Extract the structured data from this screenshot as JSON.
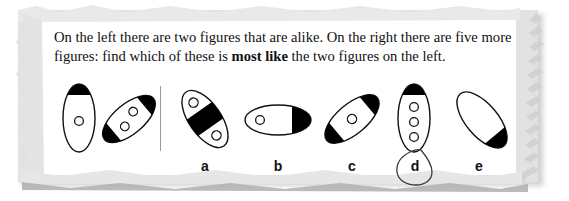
{
  "page": {
    "background_color": "#ffffff",
    "paper_color": "#ffffff",
    "paper_edge_color": "#e2e2e2",
    "shadow_color": "#c9c9c9",
    "ink_color": "#101010",
    "fill_color": "#000000",
    "divider_color": "#9a9a9a"
  },
  "question": {
    "line1_part1": "On the left there are two figures that are alike. On the right there are five more",
    "line2_part1": "figures: find which of these is ",
    "line2_bold": "most like",
    "line2_part2": " the two figures on the left."
  },
  "prompt_figures": {
    "label": "two figures that are alike",
    "items": [
      {
        "id": "prompt-figure-1",
        "shape": "ellipse",
        "orientation_deg": 0,
        "black_caps": [
          "top"
        ],
        "circle_count": 1
      },
      {
        "id": "prompt-figure-2",
        "shape": "ellipse",
        "orientation_deg": -40,
        "black_caps": [
          "top",
          "bottom"
        ],
        "circle_count": 2
      }
    ]
  },
  "options": [
    {
      "letter": "a",
      "shape": "ellipse",
      "orientation_deg": 55,
      "black_caps": [],
      "black_band": "middle",
      "circle_count": 2,
      "selected": false
    },
    {
      "letter": "b",
      "shape": "ellipse",
      "orientation_deg": 90,
      "black_caps": [
        "right"
      ],
      "black_band": "",
      "circle_count": 1,
      "selected": false
    },
    {
      "letter": "c",
      "shape": "ellipse",
      "orientation_deg": -40,
      "black_caps": [
        "top",
        "bottom"
      ],
      "black_band": "",
      "circle_count": 1,
      "selected": false
    },
    {
      "letter": "d",
      "shape": "ellipse",
      "orientation_deg": 0,
      "black_caps": [
        "top"
      ],
      "black_band": "",
      "circle_count": 3,
      "selected": true
    },
    {
      "letter": "e",
      "shape": "ellipse",
      "orientation_deg": 50,
      "black_caps": [
        "bottom"
      ],
      "black_band": "",
      "circle_count": 0,
      "selected": false
    }
  ],
  "annotation": {
    "type": "hand-drawn-circle",
    "around_label": "d"
  }
}
